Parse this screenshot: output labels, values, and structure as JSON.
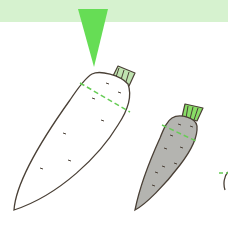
{
  "illustration": {
    "description": "Two daikon radishes: a white one (cut marker) and a grey one",
    "colors": {
      "band": "#d6f2cf",
      "arrow": "#66dd55",
      "cut_line": "#66cc55",
      "leaf": "#bfe3b0",
      "leaf_grey": "#88dd66",
      "outline": "#4a4036",
      "white_body": "#ffffff",
      "grey_body": "#b4b4b0"
    },
    "items": [
      {
        "name": "white-daikon"
      },
      {
        "name": "grey-daikon"
      },
      {
        "name": "partial-daikon"
      }
    ]
  }
}
